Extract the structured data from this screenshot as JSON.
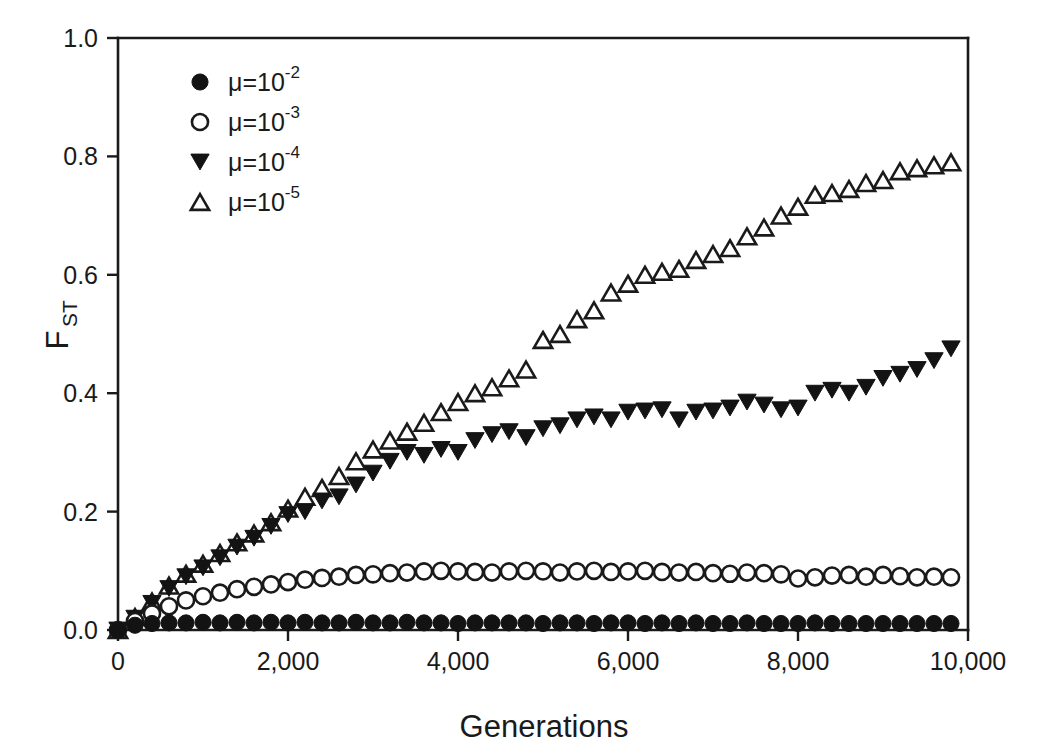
{
  "chart_data": {
    "type": "scatter",
    "title": "",
    "xlabel": "Generations",
    "ylabel": "FST",
    "ylabel_base": "F",
    "ylabel_sub": "ST",
    "xlim": [
      0,
      10000
    ],
    "ylim": [
      0,
      1.0
    ],
    "grid": false,
    "legend_position": "top-left inside",
    "x_ticks": [
      0,
      2000,
      4000,
      6000,
      8000,
      10000
    ],
    "x_tick_labels": [
      "0",
      "2,000",
      "4,000",
      "6,000",
      "8,000",
      "10,000"
    ],
    "y_ticks": [
      0.0,
      0.2,
      0.4,
      0.6,
      0.8,
      1.0
    ],
    "y_tick_labels": [
      "0.0",
      "0.2",
      "0.4",
      "0.6",
      "0.8",
      "1.0"
    ],
    "x": [
      0,
      200,
      400,
      600,
      800,
      1000,
      1200,
      1400,
      1600,
      1800,
      2000,
      2200,
      2400,
      2600,
      2800,
      3000,
      3200,
      3400,
      3600,
      3800,
      4000,
      4200,
      4400,
      4600,
      4800,
      5000,
      5200,
      5400,
      5600,
      5800,
      6000,
      6200,
      6400,
      6600,
      6800,
      7000,
      7200,
      7400,
      7600,
      7800,
      8000,
      8200,
      8400,
      8600,
      8800,
      9000,
      9200,
      9400,
      9600,
      9800
    ],
    "series": [
      {
        "name": "mu=10^-2",
        "legend_label": "μ=10",
        "legend_exponent": "-2",
        "marker": "filled-circle",
        "color": "#131313",
        "values": [
          0.0,
          0.008,
          0.011,
          0.012,
          0.012,
          0.013,
          0.012,
          0.013,
          0.012,
          0.013,
          0.012,
          0.013,
          0.012,
          0.012,
          0.013,
          0.012,
          0.012,
          0.013,
          0.012,
          0.012,
          0.011,
          0.012,
          0.012,
          0.012,
          0.012,
          0.011,
          0.012,
          0.012,
          0.011,
          0.012,
          0.012,
          0.011,
          0.012,
          0.011,
          0.012,
          0.011,
          0.011,
          0.012,
          0.011,
          0.011,
          0.011,
          0.012,
          0.011,
          0.011,
          0.011,
          0.011,
          0.011,
          0.011,
          0.011,
          0.011
        ]
      },
      {
        "name": "mu=10^-3",
        "legend_label": "μ=10",
        "legend_exponent": "-3",
        "marker": "open-circle",
        "color": "#1a1a1a",
        "values": [
          0.0,
          0.015,
          0.028,
          0.04,
          0.05,
          0.057,
          0.063,
          0.069,
          0.073,
          0.077,
          0.081,
          0.085,
          0.088,
          0.09,
          0.093,
          0.094,
          0.096,
          0.097,
          0.099,
          0.1,
          0.099,
          0.098,
          0.097,
          0.099,
          0.1,
          0.099,
          0.097,
          0.099,
          0.1,
          0.098,
          0.099,
          0.1,
          0.098,
          0.097,
          0.098,
          0.096,
          0.095,
          0.097,
          0.096,
          0.094,
          0.087,
          0.089,
          0.092,
          0.093,
          0.09,
          0.093,
          0.091,
          0.089,
          0.09,
          0.089
        ]
      },
      {
        "name": "mu=10^-4",
        "legend_label": "μ=10",
        "legend_exponent": "-4",
        "marker": "filled-triangle-down",
        "color": "#131313",
        "values": [
          0.0,
          0.02,
          0.045,
          0.07,
          0.09,
          0.105,
          0.122,
          0.14,
          0.155,
          0.175,
          0.195,
          0.2,
          0.218,
          0.225,
          0.245,
          0.265,
          0.285,
          0.3,
          0.295,
          0.305,
          0.3,
          0.32,
          0.33,
          0.335,
          0.325,
          0.34,
          0.345,
          0.355,
          0.36,
          0.355,
          0.368,
          0.37,
          0.372,
          0.355,
          0.368,
          0.37,
          0.375,
          0.385,
          0.38,
          0.372,
          0.375,
          0.4,
          0.405,
          0.4,
          0.41,
          0.425,
          0.432,
          0.44,
          0.455,
          0.475
        ]
      },
      {
        "name": "mu=10^-5",
        "legend_label": "μ=10",
        "legend_exponent": "-5",
        "marker": "open-triangle-up",
        "color": "#1a1a1a",
        "values": [
          0.0,
          0.022,
          0.048,
          0.075,
          0.095,
          0.112,
          0.13,
          0.148,
          0.163,
          0.182,
          0.205,
          0.225,
          0.24,
          0.26,
          0.285,
          0.305,
          0.32,
          0.335,
          0.35,
          0.368,
          0.385,
          0.4,
          0.41,
          0.425,
          0.44,
          0.49,
          0.5,
          0.525,
          0.54,
          0.57,
          0.585,
          0.6,
          0.605,
          0.61,
          0.625,
          0.635,
          0.645,
          0.665,
          0.68,
          0.7,
          0.715,
          0.735,
          0.738,
          0.745,
          0.755,
          0.76,
          0.775,
          0.78,
          0.785,
          0.79
        ]
      }
    ]
  },
  "legend": {
    "entries": [
      {
        "marker": "filled-circle",
        "label": "μ=10",
        "exponent": "-2"
      },
      {
        "marker": "open-circle",
        "label": "μ=10",
        "exponent": "-3"
      },
      {
        "marker": "filled-triangle-down",
        "label": "μ=10",
        "exponent": "-4"
      },
      {
        "marker": "open-triangle-up",
        "label": "μ=10",
        "exponent": "-5"
      }
    ]
  },
  "colors": {
    "foreground": "#1a1a1a",
    "marker_fill": "#131313",
    "background": "#ffffff"
  }
}
